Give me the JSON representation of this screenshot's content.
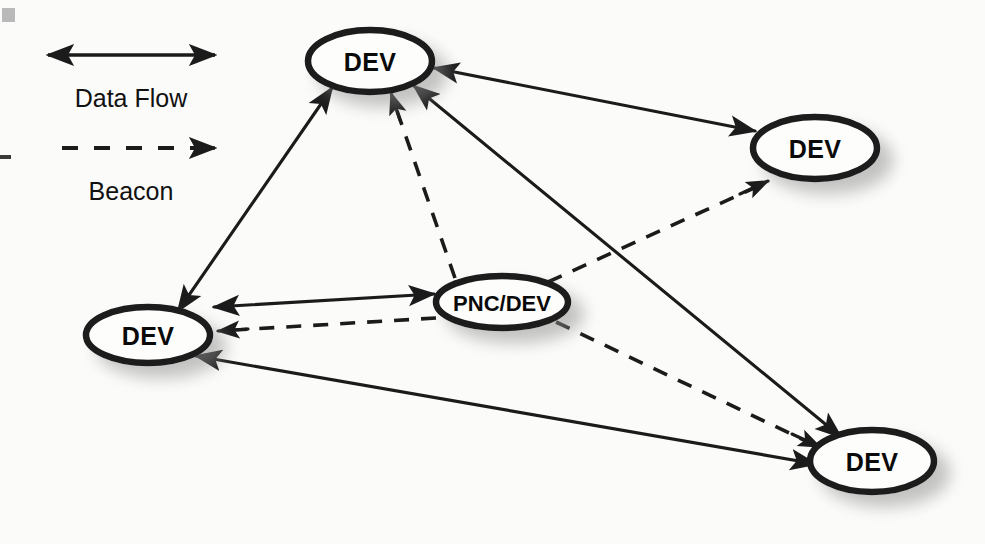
{
  "figure": {
    "background_color": "#fbfbf9",
    "ink_color": "#1b1b1b",
    "node_fill": "#fdfdfb",
    "shadow_color": "#9a9a9a"
  },
  "legend": {
    "title": "",
    "items": [
      {
        "id": "data-flow",
        "label": "Data Flow",
        "line_style": "solid",
        "arrow": "double",
        "x1": 48,
        "y1": 55,
        "x2": 215,
        "y2": 55,
        "label_x": 131,
        "label_y": 98
      },
      {
        "id": "beacon",
        "label": "Beacon",
        "line_style": "dashed",
        "arrow": "single",
        "x1": 62,
        "y1": 148,
        "x2": 215,
        "y2": 148,
        "label_x": 131,
        "label_y": 190
      }
    ]
  },
  "nodes": [
    {
      "id": "dev-top",
      "label": "DEV",
      "cx": 370,
      "cy": 61,
      "rx": 62,
      "ry": 31
    },
    {
      "id": "dev-right",
      "label": "DEV",
      "cx": 815,
      "cy": 148,
      "rx": 62,
      "ry": 31
    },
    {
      "id": "dev-bottom-left",
      "label": "DEV",
      "cx": 148,
      "cy": 335,
      "rx": 62,
      "ry": 28
    },
    {
      "id": "pnc-dev-center",
      "label": "PNC/DEV",
      "cx": 502,
      "cy": 302,
      "rx": 66,
      "ry": 26
    },
    {
      "id": "dev-bottom-right",
      "label": "DEV",
      "cx": 872,
      "cy": 461,
      "rx": 62,
      "ry": 31
    }
  ],
  "edges": [
    {
      "id": "edge-top-bottomleft",
      "from": "dev-top",
      "to": "dev-bottom-left",
      "type": "Data Flow",
      "style": "solid",
      "arrow": "double"
    },
    {
      "id": "edge-top-right",
      "from": "dev-top",
      "to": "dev-right",
      "type": "Data Flow",
      "style": "solid",
      "arrow": "double"
    },
    {
      "id": "edge-top-bottomright",
      "from": "dev-top",
      "to": "dev-bottom-right",
      "type": "Data Flow",
      "style": "solid",
      "arrow": "double"
    },
    {
      "id": "edge-bottomleft-center",
      "from": "dev-bottom-left",
      "to": "pnc-dev-center",
      "type": "Data Flow",
      "style": "solid",
      "arrow": "double"
    },
    {
      "id": "edge-bottomleft-bottomright",
      "from": "dev-bottom-left",
      "to": "dev-bottom-right",
      "type": "Data Flow",
      "style": "solid",
      "arrow": "double"
    },
    {
      "id": "edge-center-top",
      "from": "pnc-dev-center",
      "to": "dev-top",
      "type": "Beacon",
      "style": "dashed",
      "arrow": "single"
    },
    {
      "id": "edge-center-bottomleft",
      "from": "pnc-dev-center",
      "to": "dev-bottom-left",
      "type": "Beacon",
      "style": "dashed",
      "arrow": "single"
    },
    {
      "id": "edge-center-right",
      "from": "pnc-dev-center",
      "to": "dev-right",
      "type": "Beacon",
      "style": "dashed",
      "arrow": "single"
    },
    {
      "id": "edge-center-bottomright",
      "from": "pnc-dev-center",
      "to": "dev-bottom-right",
      "type": "Beacon",
      "style": "dashed",
      "arrow": "single"
    }
  ],
  "artifacts": [
    {
      "id": "scan-square",
      "x": 2,
      "y": 8,
      "w": 13,
      "h": 14
    },
    {
      "id": "scan-dash",
      "x": 0,
      "y": 155,
      "w": 11,
      "h": 4
    }
  ]
}
